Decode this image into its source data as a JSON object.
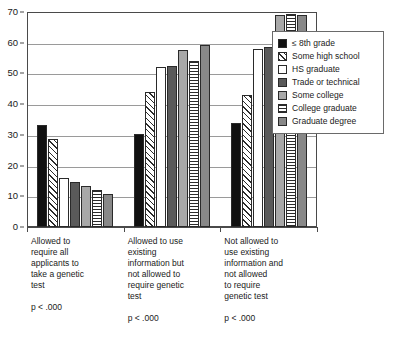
{
  "chart_data": {
    "type": "bar",
    "title": "",
    "subtitle": "",
    "xlabel": "",
    "ylabel": "",
    "ylim": [
      0,
      70
    ],
    "y_ticks": [
      0,
      10,
      20,
      30,
      40,
      50,
      60,
      70
    ],
    "grid": true,
    "legend_position": "right",
    "categories": [
      "Allowed to require all applicants to take a genetic test",
      "Allowed to use existing information but not allowed to require genetic test",
      "Not allowed to use existing information and not allowed to require genetic test"
    ],
    "category_lines": [
      [
        "Allowed to",
        "require all",
        "applicants to",
        "take a genetic",
        "test"
      ],
      [
        "Allowed to use",
        "existing",
        "information but",
        "not allowed to",
        "require genetic",
        "test"
      ],
      [
        "Not allowed to",
        "use existing",
        "information and",
        "not allowed",
        "to require",
        "genetic test"
      ]
    ],
    "category_annotations": [
      "p < .000",
      "p < .000",
      "p < .000"
    ],
    "series": [
      {
        "name": "≤ 8th grade",
        "pattern": "solid-black",
        "values": [
          33.2,
          30.4,
          33.8
        ]
      },
      {
        "name": "Some high school",
        "pattern": "diag-hatch",
        "values": [
          28.6,
          44.0,
          43.0
        ]
      },
      {
        "name": "HS graduate",
        "pattern": "white",
        "values": [
          15.9,
          52.2,
          58.1
        ]
      },
      {
        "name": "Trade or technical",
        "pattern": "dark-gray",
        "values": [
          14.5,
          52.5,
          58.7
        ]
      },
      {
        "name": "Some college",
        "pattern": "med-gray",
        "values": [
          13.3,
          57.5,
          69.1
        ]
      },
      {
        "name": "College graduate",
        "pattern": "horiz-stripe",
        "values": [
          12.0,
          53.9,
          69.2
        ]
      },
      {
        "name": "Graduate degree",
        "pattern": "gray",
        "values": [
          10.8,
          59.3,
          69.0
        ]
      }
    ]
  },
  "legend": {
    "items": [
      {
        "label": "≤ 8th grade",
        "pattern": "solid-black"
      },
      {
        "label": "Some high school",
        "pattern": "diag-hatch"
      },
      {
        "label": "HS graduate",
        "pattern": "white"
      },
      {
        "label": "Trade or technical",
        "pattern": "dark-gray"
      },
      {
        "label": "Some college",
        "pattern": "med-gray"
      },
      {
        "label": "College graduate",
        "pattern": "horiz-stripe"
      },
      {
        "label": "Graduate degree",
        "pattern": "gray"
      }
    ]
  },
  "colors": {
    "axis": "#4a4a4a",
    "grid": "#9a9a9a",
    "text": "#1a1a1a",
    "background": "#ffffff"
  }
}
